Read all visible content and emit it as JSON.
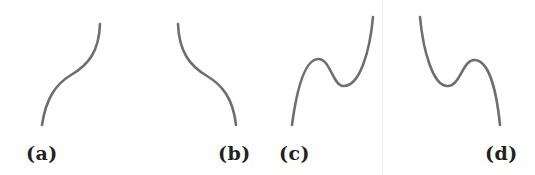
{
  "figure": {
    "panels": [
      {
        "id": "a",
        "label": "(a)",
        "description": "increasing cubic with inflection, no turning points"
      },
      {
        "id": "b",
        "label": "(b)",
        "description": "decreasing cubic with inflection, no turning points"
      },
      {
        "id": "c",
        "label": "(c)",
        "description": "positive-leading cubic with local max then local min"
      },
      {
        "id": "d",
        "label": "(d)",
        "description": "negative-leading cubic with local min then local max"
      }
    ],
    "stroke_color": "#6e6e6e",
    "label_color": "#222222"
  }
}
